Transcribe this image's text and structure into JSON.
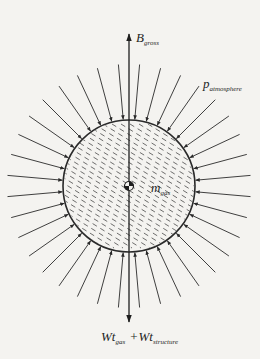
{
  "diagram": {
    "type": "free-body force diagram of a buoyant gas sphere",
    "colors": {
      "background": "#f4f3f0",
      "stroke": "#2a2a2a",
      "hatch": "#4a4a4a"
    },
    "geometry": {
      "center": [
        129,
        186
      ],
      "sphere_radius": 66,
      "pressure_arrow_outer_radius": 122,
      "pressure_arrow_angle_step_deg": 10,
      "pressure_arrow_angle_offset_deg": 5,
      "vertical_axis_top": 34,
      "vertical_axis_bottom": 322
    },
    "labels": {
      "buoyancy": {
        "main": "B",
        "sub": "gross"
      },
      "pressure": {
        "main": "p",
        "sub": "atmosphere"
      },
      "mass": {
        "main": "m",
        "sub": "gas"
      },
      "weight": {
        "term1_main": "Wt",
        "term1_sub": "gas",
        "operator": "+",
        "term2_main": "Wt",
        "term2_sub": "structure"
      }
    },
    "nodes": [
      {
        "id": "sphere",
        "label": "gas volume (hatched)"
      },
      {
        "id": "center-of-mass",
        "label": "center of mass symbol"
      }
    ],
    "edges": [
      {
        "from": "center",
        "to": "up",
        "label": "B_gross",
        "kind": "force-arrow"
      },
      {
        "from": "center",
        "to": "down",
        "label": "Wt_gas + Wt_structure",
        "kind": "force-arrow"
      },
      {
        "from": "outside",
        "to": "sphere-surface",
        "label": "p_atmosphere",
        "kind": "radial-pressure-arrows"
      }
    ]
  }
}
